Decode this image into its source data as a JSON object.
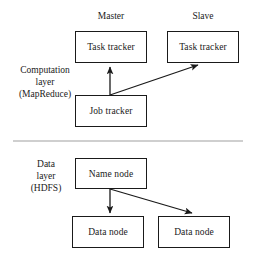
{
  "diagram": {
    "type": "block-diagram",
    "colors": {
      "stroke": "#1a1a1a",
      "fill": "#ffffff",
      "divider": "#cfcfcf"
    },
    "column_headers": [
      {
        "id": "master",
        "label": "Master"
      },
      {
        "id": "slave",
        "label": "Slave"
      }
    ],
    "layers": [
      {
        "id": "computation-layer",
        "label_lines": [
          "Computation",
          "layer",
          "(MapReduce)"
        ],
        "line1": "Computation",
        "line2": "layer",
        "line3": "(MapReduce)",
        "nodes": [
          {
            "id": "master-task-tracker",
            "label": "Task tracker",
            "column": "master"
          },
          {
            "id": "slave-task-tracker",
            "label": "Task tracker",
            "column": "slave"
          },
          {
            "id": "job-tracker",
            "label": "Job tracker",
            "column": "master"
          }
        ]
      },
      {
        "id": "data-layer",
        "label_lines": [
          "Data",
          "layer",
          "(HDFS)"
        ],
        "line1": "Data",
        "line2": "layer",
        "line3": "(HDFS)",
        "nodes": [
          {
            "id": "name-node",
            "label": "Name node",
            "column": "master"
          },
          {
            "id": "data-node-left",
            "label": "Data node",
            "column": "master"
          },
          {
            "id": "data-node-right",
            "label": "Data node",
            "column": "slave"
          }
        ]
      }
    ],
    "connections": [
      {
        "id": "jobtracker-to-master-tasktracker",
        "from": "job-tracker",
        "to": "master-task-tracker",
        "style": "arrow"
      },
      {
        "id": "jobtracker-to-slave-tasktracker",
        "from": "job-tracker",
        "to": "slave-task-tracker",
        "style": "arrow"
      },
      {
        "id": "namenode-to-data-node-left",
        "from": "name-node",
        "to": "data-node-left",
        "style": "arrow"
      },
      {
        "id": "namenode-to-data-node-right",
        "from": "name-node",
        "to": "data-node-right",
        "style": "arrow"
      }
    ]
  }
}
